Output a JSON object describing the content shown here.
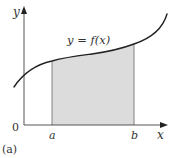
{
  "figure": {
    "panel_label": "(a)",
    "curve_label": "y = f(x)",
    "axes": {
      "x_label": "x",
      "y_label": "y",
      "origin_label": "0"
    },
    "bounds": {
      "lower_label": "a",
      "upper_label": "b"
    },
    "colors": {
      "curve": "#222222",
      "axis": "#444444",
      "shaded_region": "#dcdcdc",
      "bound_lines": "#777777"
    }
  }
}
